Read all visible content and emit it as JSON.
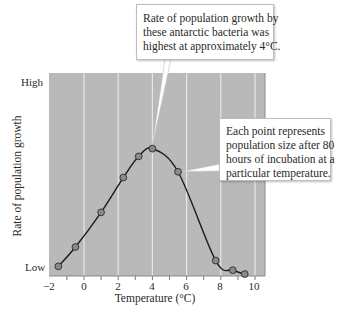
{
  "chart_data": {
    "type": "line",
    "title": "",
    "xlabel": "Temperature (°C)",
    "ylabel": "Rate of population growth",
    "xlim": [
      -2,
      10.6
    ],
    "ylim": [
      "Low",
      "High"
    ],
    "x_ticks": [
      -2,
      0,
      2,
      4,
      6,
      8,
      10
    ],
    "x_tick_labels": [
      "−2",
      "0",
      "2",
      "4",
      "6",
      "8",
      "10"
    ],
    "y_tick_labels": [
      "Low",
      "High"
    ],
    "grid": "vertical lines at every 2°C",
    "series": [
      {
        "name": "Antarctic bacteria growth rate (relative, 0=Low, 100=High)",
        "x": [
          -1.5,
          -0.5,
          1.0,
          2.3,
          3.2,
          4.0,
          5.5,
          7.7,
          8.7,
          9.4
        ],
        "values": [
          5,
          15,
          33,
          51,
          62,
          66,
          54,
          8,
          3,
          1
        ]
      }
    ],
    "annotations": [
      {
        "text": "Rate of population growth by these antarctic bacteria was highest at approximately 4°C.",
        "points_to": {
          "x": 4.0,
          "value": 66
        }
      },
      {
        "text": "Each point represents population size after 80 hours of incubation at a particular temperature.",
        "points_to": {
          "x": 5.5,
          "value": 54
        }
      }
    ],
    "colors": {
      "plot_background": "#b9b9b9",
      "grid": "#e6e6e6",
      "line": "#1a1a1a",
      "marker_fill": "#8a8a8a"
    }
  },
  "labels": {
    "y_axis": "Rate of population growth",
    "x_axis": "Temperature (°C)",
    "y_high": "High",
    "y_low": "Low",
    "x_ticks": [
      "−2",
      "0",
      "2",
      "4",
      "6",
      "8",
      "10"
    ]
  },
  "callouts": {
    "peak": [
      "Rate of population growth by",
      "these antarctic bacteria was",
      "highest at approximately 4°C."
    ],
    "points": [
      "Each point represents",
      "population size after 80",
      "hours of incubation at a",
      "particular temperature."
    ]
  }
}
